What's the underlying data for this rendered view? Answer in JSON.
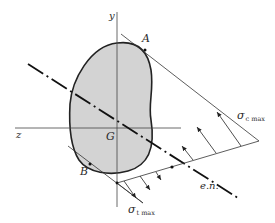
{
  "figure": {
    "colors": {
      "section_fill": "#d3d3d3",
      "section_stroke": "#222222",
      "line": "#333333",
      "background": "#ffffff"
    }
  },
  "labels": {
    "y_axis": "y",
    "z_axis": "z",
    "centroid": "G",
    "point_a": "A",
    "point_b": "B",
    "neutral_axis": "e.n.",
    "sigma_c": {
      "symbol": "σ",
      "subscript": "c max"
    },
    "sigma_t": {
      "symbol": "σ",
      "subscript": "t max"
    }
  }
}
